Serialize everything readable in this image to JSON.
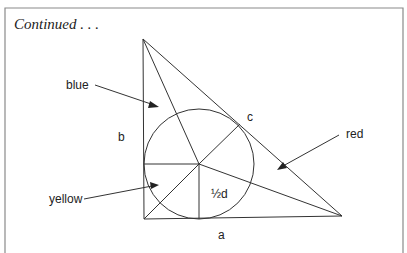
{
  "header": {
    "title": "Continued . . ."
  },
  "diagram": {
    "labels": {
      "blue": "blue",
      "yellow": "yellow",
      "red": "red",
      "b": "b",
      "a": "a",
      "c": "c",
      "half_d": "½d"
    },
    "colors": {
      "line": "#333333",
      "frame": "#8a8a8a"
    },
    "triangle": {
      "vertices": [
        [
          143,
          39
        ],
        [
          144,
          219
        ],
        [
          342,
          216
        ]
      ]
    },
    "incircle": {
      "cx": 199,
      "cy": 164,
      "r": 55
    }
  }
}
